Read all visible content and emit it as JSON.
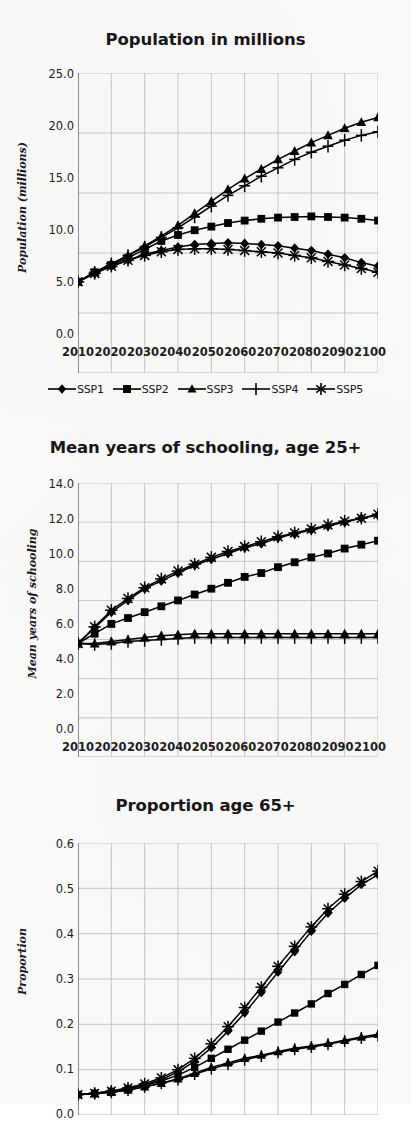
{
  "document": {
    "type": "figure",
    "panel_count": 3,
    "background_color": "#fafaf9",
    "ink_color": "#000000",
    "grid_color": "#b9b9bd"
  },
  "legend": {
    "position": "below-first-panel",
    "items": [
      {
        "label": "SSP1",
        "marker": "diamond"
      },
      {
        "label": "SSP2",
        "marker": "square"
      },
      {
        "label": "SSP3",
        "marker": "triangle"
      },
      {
        "label": "SSP4",
        "marker": "plus"
      },
      {
        "label": "SSP5",
        "marker": "asterisk"
      }
    ]
  },
  "chart_data": [
    {
      "id": "population",
      "type": "line",
      "title": "Population in millions",
      "xlabel": "",
      "ylabel": "Population (millions)",
      "grid": true,
      "legend_position": "bottom",
      "x": [
        2010,
        2015,
        2020,
        2025,
        2030,
        2035,
        2040,
        2045,
        2050,
        2055,
        2060,
        2065,
        2070,
        2075,
        2080,
        2085,
        2090,
        2095,
        2100
      ],
      "xticks": [
        "2010",
        "2020",
        "2030",
        "2040",
        "2050",
        "2060",
        "2070",
        "2080",
        "2090",
        "2100"
      ],
      "yticks": [
        "0.0",
        "5.0",
        "10.0",
        "15.0",
        "20.0",
        "25.0"
      ],
      "xlim": [
        2010,
        2100
      ],
      "ylim": [
        0.0,
        25.0
      ],
      "series": [
        {
          "name": "SSP1",
          "marker": "diamond",
          "values": [
            7.6,
            8.3,
            8.9,
            9.4,
            9.9,
            10.2,
            10.5,
            10.7,
            10.8,
            10.85,
            10.8,
            10.7,
            10.6,
            10.4,
            10.2,
            9.9,
            9.6,
            9.2,
            8.9
          ]
        },
        {
          "name": "SSP2",
          "marker": "square",
          "values": [
            7.6,
            8.4,
            9.0,
            9.6,
            10.3,
            11.0,
            11.5,
            11.9,
            12.2,
            12.5,
            12.7,
            12.85,
            12.95,
            13.0,
            13.05,
            13.0,
            12.95,
            12.85,
            12.7
          ]
        },
        {
          "name": "SSP3",
          "marker": "triangle",
          "values": [
            7.6,
            8.4,
            9.1,
            9.8,
            10.6,
            11.4,
            12.3,
            13.3,
            14.3,
            15.3,
            16.2,
            17.0,
            17.8,
            18.5,
            19.2,
            19.8,
            20.4,
            20.9,
            21.3
          ]
        },
        {
          "name": "SSP4",
          "marker": "plus",
          "values": [
            7.6,
            8.4,
            9.1,
            9.8,
            10.5,
            11.3,
            12.1,
            13.0,
            13.9,
            14.8,
            15.6,
            16.4,
            17.1,
            17.8,
            18.4,
            18.9,
            19.4,
            19.8,
            20.1
          ]
        },
        {
          "name": "SSP5",
          "marker": "asterisk",
          "values": [
            7.6,
            8.3,
            8.9,
            9.4,
            9.8,
            10.1,
            10.3,
            10.35,
            10.35,
            10.3,
            10.2,
            10.1,
            10.0,
            9.8,
            9.6,
            9.3,
            9.0,
            8.7,
            8.4
          ]
        }
      ]
    },
    {
      "id": "schooling",
      "type": "line",
      "title": "Mean years of schooling, age 25+",
      "xlabel": "",
      "ylabel": "Mean years of schooling",
      "grid": true,
      "legend_position": "none",
      "x": [
        2010,
        2015,
        2020,
        2025,
        2030,
        2035,
        2040,
        2045,
        2050,
        2055,
        2060,
        2065,
        2070,
        2075,
        2080,
        2085,
        2090,
        2095,
        2100
      ],
      "xticks": [
        "2010",
        "2020",
        "2030",
        "2040",
        "2050",
        "2060",
        "2070",
        "2080",
        "2090",
        "2100"
      ],
      "yticks": [
        "0.0",
        "2.0",
        "4.0",
        "6.0",
        "8.0",
        "10.0",
        "12.0",
        "14.0"
      ],
      "xlim": [
        2010,
        2100
      ],
      "ylim": [
        0.0,
        14.0
      ],
      "series": [
        {
          "name": "SSP1",
          "marker": "diamond",
          "values": [
            5.8,
            6.6,
            7.4,
            8.0,
            8.6,
            9.0,
            9.4,
            9.8,
            10.1,
            10.4,
            10.7,
            10.9,
            11.2,
            11.4,
            11.6,
            11.8,
            12.0,
            12.2,
            12.35
          ]
        },
        {
          "name": "SSP2",
          "marker": "square",
          "values": [
            5.8,
            6.3,
            6.8,
            7.1,
            7.4,
            7.7,
            8.0,
            8.3,
            8.6,
            8.9,
            9.2,
            9.4,
            9.7,
            9.95,
            10.2,
            10.4,
            10.65,
            10.85,
            11.05
          ]
        },
        {
          "name": "SSP3",
          "marker": "triangle",
          "values": [
            5.8,
            5.8,
            5.9,
            6.0,
            6.1,
            6.2,
            6.25,
            6.3,
            6.3,
            6.3,
            6.3,
            6.3,
            6.3,
            6.3,
            6.3,
            6.3,
            6.3,
            6.3,
            6.3
          ]
        },
        {
          "name": "SSP4",
          "marker": "plus",
          "values": [
            5.8,
            5.75,
            5.8,
            5.9,
            5.95,
            6.0,
            6.05,
            6.1,
            6.1,
            6.1,
            6.1,
            6.1,
            6.1,
            6.1,
            6.1,
            6.1,
            6.1,
            6.1,
            6.1
          ]
        },
        {
          "name": "SSP5",
          "marker": "asterisk",
          "values": [
            5.8,
            6.65,
            7.5,
            8.1,
            8.65,
            9.1,
            9.5,
            9.85,
            10.2,
            10.5,
            10.75,
            11.0,
            11.25,
            11.45,
            11.65,
            11.85,
            12.05,
            12.2,
            12.4
          ]
        }
      ]
    },
    {
      "id": "proportion65",
      "type": "line",
      "title": "Proportion age 65+",
      "xlabel": "",
      "ylabel": "Proportion",
      "grid": true,
      "legend_position": "none",
      "x": [
        2010,
        2015,
        2020,
        2025,
        2030,
        2035,
        2040,
        2045,
        2050,
        2055,
        2060,
        2065,
        2070,
        2075,
        2080,
        2085,
        2090,
        2095,
        2100
      ],
      "xticks": [
        "2010",
        "2020",
        "2030",
        "2040",
        "2050",
        "2060",
        "2070",
        "2080",
        "2090",
        "2100"
      ],
      "yticks": [
        "0.0",
        "0.1",
        "0.2",
        "0.3",
        "0.4",
        "0.5",
        "0.6"
      ],
      "xlim": [
        2010,
        2100
      ],
      "ylim": [
        0.0,
        0.6
      ],
      "series": [
        {
          "name": "SSP1",
          "marker": "diamond",
          "values": [
            0.045,
            0.048,
            0.052,
            0.058,
            0.066,
            0.078,
            0.095,
            0.118,
            0.148,
            0.185,
            0.225,
            0.27,
            0.315,
            0.36,
            0.405,
            0.445,
            0.478,
            0.508,
            0.53
          ]
        },
        {
          "name": "SSP2",
          "marker": "square",
          "values": [
            0.045,
            0.048,
            0.052,
            0.058,
            0.065,
            0.075,
            0.088,
            0.105,
            0.125,
            0.145,
            0.165,
            0.185,
            0.205,
            0.225,
            0.245,
            0.268,
            0.288,
            0.31,
            0.33
          ]
        },
        {
          "name": "SSP3",
          "marker": "triangle",
          "values": [
            0.045,
            0.047,
            0.05,
            0.055,
            0.062,
            0.07,
            0.08,
            0.092,
            0.105,
            0.115,
            0.125,
            0.132,
            0.14,
            0.147,
            0.152,
            0.158,
            0.165,
            0.172,
            0.178
          ]
        },
        {
          "name": "SSP4",
          "marker": "plus",
          "values": [
            0.045,
            0.047,
            0.05,
            0.055,
            0.062,
            0.07,
            0.078,
            0.09,
            0.102,
            0.112,
            0.122,
            0.13,
            0.138,
            0.145,
            0.15,
            0.156,
            0.163,
            0.17,
            0.175
          ]
        },
        {
          "name": "SSP5",
          "marker": "asterisk",
          "values": [
            0.045,
            0.048,
            0.053,
            0.06,
            0.069,
            0.082,
            0.1,
            0.125,
            0.157,
            0.195,
            0.237,
            0.282,
            0.328,
            0.372,
            0.415,
            0.455,
            0.487,
            0.515,
            0.538
          ]
        }
      ]
    }
  ]
}
